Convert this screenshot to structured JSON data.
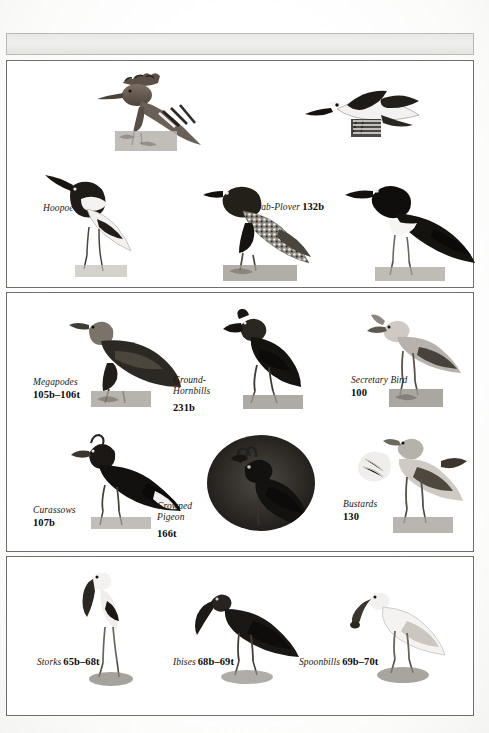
{
  "page": {
    "kind": "book-plate-index",
    "background_color": "#ffffff",
    "border_color": "#6f6f6d",
    "top_band_color": "#e8e8e6"
  },
  "panels": [
    {
      "id": "panel-1",
      "entries": [
        {
          "name": "Hoopoe",
          "pages": "228b",
          "layout": "inline"
        },
        {
          "name": "Crab-Plover",
          "pages": "132b",
          "layout": "inline"
        },
        {
          "name": "Avocets and Stilts",
          "pages": "133b–134t",
          "layout": "stack"
        },
        {
          "name": "Plovers",
          "pages": "137b–140",
          "layout": "stack"
        },
        {
          "name": "Oystercatchers",
          "pages": "133t",
          "layout": "stack"
        }
      ]
    },
    {
      "id": "panel-2",
      "entries": [
        {
          "name": "Megapodes",
          "pages": "105b–106t",
          "layout": "stack"
        },
        {
          "name": "Ground-Hornbills",
          "pages": "231b",
          "layout": "two"
        },
        {
          "name": "Secretary Bird",
          "pages": "100",
          "layout": "stack"
        },
        {
          "name": "Curassows",
          "pages": "107b",
          "layout": "stack"
        },
        {
          "name": "Crowned Pigeon",
          "pages": "166t",
          "layout": "two"
        },
        {
          "name": "Bustards",
          "pages": "130",
          "layout": "stack"
        }
      ]
    },
    {
      "id": "panel-3",
      "entries": [
        {
          "name": "Storks",
          "pages": "65b–68t",
          "layout": "inline"
        },
        {
          "name": "Ibises",
          "pages": "68b–69t",
          "layout": "inline"
        },
        {
          "name": "Spoonbills",
          "pages": "69b–70t",
          "layout": "inline"
        }
      ]
    }
  ],
  "figures": {
    "hoopoe": "hoopoe-photo",
    "crab_plover": "crab-plover-photo",
    "avocet": "avocet-photo",
    "plover": "plover-photo",
    "oystercatcher": "oystercatcher-photo",
    "megapode": "megapode-photo",
    "ground_hornbill": "ground-hornbill-photo",
    "secretary_bird": "secretary-bird-photo",
    "curassow": "curassow-photo",
    "crowned_pigeon": "crowned-pigeon-photo",
    "bustard": "bustard-photo",
    "stork": "stork-photo",
    "ibis": "ibis-photo",
    "spoonbill": "spoonbill-photo"
  }
}
